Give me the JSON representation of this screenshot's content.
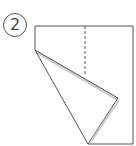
{
  "step": {
    "number": "2"
  },
  "diagram": {
    "colors": {
      "stroke": "#555555",
      "shadow": "#bbbbbb",
      "paper": "#ffffff"
    }
  }
}
